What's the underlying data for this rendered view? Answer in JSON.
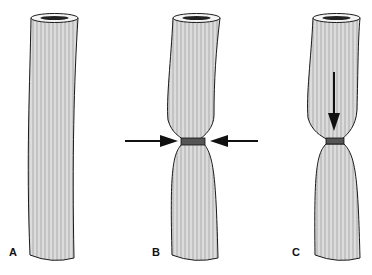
{
  "figure": {
    "panels": [
      {
        "label": "A",
        "description": "Intact tube"
      },
      {
        "label": "B",
        "description": "Tube constricted by lateral compression"
      },
      {
        "label": "C",
        "description": "Constricted tube with downward force"
      }
    ],
    "colors": {
      "tube_fill": "#d9d9d9",
      "stroke": "#1a1a1a",
      "background": "#ffffff"
    }
  }
}
